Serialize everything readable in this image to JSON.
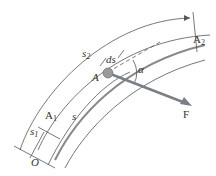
{
  "diagram": {
    "type": "particle on curved path",
    "labels": {
      "s2": "s",
      "s2_sub": "2",
      "A2": "A",
      "A2_sub": "2",
      "A": "A",
      "ds": "ds",
      "alpha": "α",
      "F": "F",
      "A1": "A",
      "A1_sub": "1",
      "s1": "s",
      "s1_sub": "1",
      "s": "s",
      "O": "O"
    },
    "colors": {
      "line": "#555555",
      "force": "#7a7f85",
      "particle": "#9a9a9a"
    }
  }
}
